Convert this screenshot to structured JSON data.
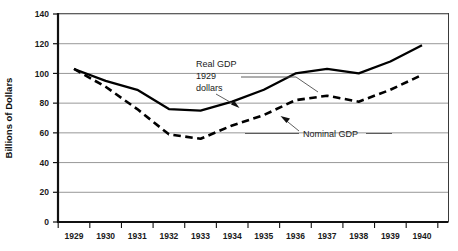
{
  "chart_data": {
    "type": "line",
    "title": "",
    "xlabel": "",
    "ylabel": "Billions of Dollars",
    "ylim": [
      0,
      140
    ],
    "ytick_values": [
      0,
      20,
      40,
      60,
      80,
      100,
      120,
      140
    ],
    "ytick_labels": [
      "0",
      "20",
      "40",
      "60",
      "80",
      "100",
      "120",
      "140"
    ],
    "grid": true,
    "grid_axis": "y",
    "legend": "inline-annotations",
    "categories": [
      "1929",
      "1930",
      "1931",
      "1932",
      "1933",
      "1934",
      "1935",
      "1936",
      "1937",
      "1938",
      "1939",
      "1940"
    ],
    "x": [
      1929,
      1930,
      1931,
      1932,
      1933,
      1934,
      1935,
      1936,
      1937,
      1938,
      1939,
      1940
    ],
    "series": [
      {
        "name": "Real GDP 1929 dollars",
        "style": "solid",
        "color": "#000000",
        "values": [
          103,
          95,
          89,
          76,
          75,
          81,
          89,
          100,
          103,
          100,
          108,
          119
        ]
      },
      {
        "name": "Nominal GDP",
        "style": "dashed",
        "color": "#000000",
        "values": [
          103,
          91,
          76,
          59,
          56,
          65,
          72,
          82,
          85,
          81,
          89,
          99
        ]
      }
    ],
    "annotations": [
      {
        "name": "real-gdp-label",
        "lines": [
          "Real GDP",
          "1929",
          "dollars"
        ],
        "points_to_series": "Real GDP 1929 dollars"
      },
      {
        "name": "nominal-gdp-label",
        "lines": [
          "Nominal GDP"
        ],
        "points_to_series": "Nominal GDP"
      }
    ]
  },
  "axis": {
    "y_title": "Billions of Dollars",
    "y_ticks": [
      {
        "label": "140"
      },
      {
        "label": "120"
      },
      {
        "label": "100"
      },
      {
        "label": "80"
      },
      {
        "label": "60"
      },
      {
        "label": "40"
      },
      {
        "label": "20"
      },
      {
        "label": "0"
      }
    ],
    "x_ticks": [
      {
        "label": "1929"
      },
      {
        "label": "1930"
      },
      {
        "label": "1931"
      },
      {
        "label": "1932"
      },
      {
        "label": "1933"
      },
      {
        "label": "1934"
      },
      {
        "label": "1935"
      },
      {
        "label": "1936"
      },
      {
        "label": "1937"
      },
      {
        "label": "1938"
      },
      {
        "label": "1939"
      },
      {
        "label": "1940"
      }
    ]
  },
  "annotations": {
    "real_gdp": {
      "line1": "Real GDP",
      "line2": "1929",
      "line3": "dollars"
    },
    "nominal_gdp": {
      "line1": "Nominal GDP"
    }
  },
  "colors": {
    "series_line": "#000000",
    "gridline": "#8c8c8c",
    "axis": "#000000",
    "background": "#ffffff"
  }
}
